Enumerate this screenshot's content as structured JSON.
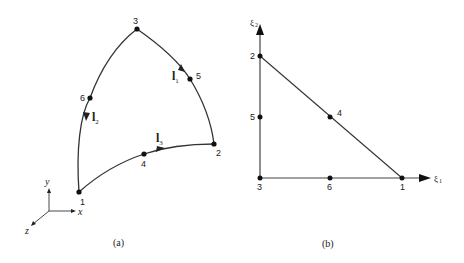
{
  "panel_a": {
    "caption": "(a)",
    "nodes": [
      {
        "id": "1",
        "label": "1"
      },
      {
        "id": "2",
        "label": "2"
      },
      {
        "id": "3",
        "label": "3"
      },
      {
        "id": "4",
        "label": "4"
      },
      {
        "id": "5",
        "label": "5"
      },
      {
        "id": "6",
        "label": "6"
      }
    ],
    "tangents": [
      {
        "symbol": "l",
        "subscript": "1"
      },
      {
        "symbol": "l",
        "subscript": "2"
      },
      {
        "symbol": "l",
        "subscript": "3"
      }
    ],
    "axes": {
      "x": "x",
      "y": "y",
      "z": "z"
    }
  },
  "panel_b": {
    "caption": "(b)",
    "nodes": [
      {
        "id": "1",
        "label": "1"
      },
      {
        "id": "2",
        "label": "2"
      },
      {
        "id": "3",
        "label": "3"
      },
      {
        "id": "4",
        "label": "4"
      },
      {
        "id": "5",
        "label": "5"
      },
      {
        "id": "6",
        "label": "6"
      }
    ],
    "axes": {
      "xi1": {
        "symbol": "ξ",
        "subscript": "1"
      },
      "xi2": {
        "symbol": "ξ",
        "subscript": "2"
      }
    }
  },
  "colors": {
    "ink": "#222222",
    "line": "#333333",
    "background": "#ffffff"
  }
}
